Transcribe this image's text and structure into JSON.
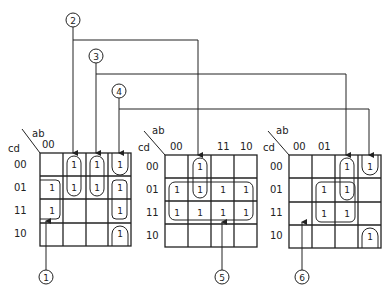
{
  "diagram": {
    "type": "karnaugh-maps",
    "row_var": "cd",
    "col_var": "ab",
    "maps": [
      {
        "id": "map-1",
        "col_labels_shown": [
          "00"
        ],
        "row_labels": [
          "00",
          "01",
          "11",
          "10"
        ],
        "cells": [
          [
            "",
            "1",
            "1",
            "1"
          ],
          [
            "1",
            "1",
            "1",
            "1"
          ],
          [
            "1",
            "",
            "",
            "1"
          ],
          [
            "",
            "",
            "",
            "1"
          ]
        ]
      },
      {
        "id": "map-2",
        "col_labels_shown": [
          "00",
          "",
          "11",
          "10"
        ],
        "row_labels": [
          "00",
          "01",
          "11",
          "10"
        ],
        "cells": [
          [
            "",
            "1",
            "",
            ""
          ],
          [
            "1",
            "1",
            "1",
            "1"
          ],
          [
            "1",
            "1",
            "1",
            "1"
          ],
          [
            "",
            "",
            "",
            ""
          ]
        ]
      },
      {
        "id": "map-3",
        "col_labels_shown": [
          "00",
          "01"
        ],
        "row_labels": [
          "00",
          "01",
          "11",
          "10"
        ],
        "cells": [
          [
            "",
            "",
            "1",
            "1"
          ],
          [
            "",
            "1",
            "1",
            ""
          ],
          [
            "",
            "1",
            "1",
            ""
          ],
          [
            "",
            "",
            "",
            "1"
          ]
        ]
      }
    ],
    "callouts": [
      {
        "label": "1",
        "target": "map-1 loop cd=01,11 ab=00"
      },
      {
        "label": "2",
        "target": "map-1 col ab=01 and map-2 col ab=01"
      },
      {
        "label": "3",
        "target": "map-1 col ab=11 and map-3 col ab=11"
      },
      {
        "label": "4",
        "target": "map-1 col ab=10 and map-3 col ab=10"
      },
      {
        "label": "5",
        "target": "map-2 loop rows cd=01,11"
      },
      {
        "label": "6",
        "target": "map-3 loop cd=01,11 ab=01,11"
      }
    ]
  }
}
